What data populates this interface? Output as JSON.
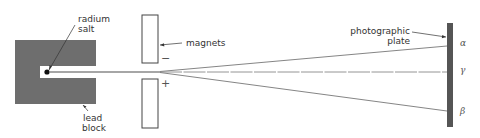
{
  "diagram": {
    "colors": {
      "lead": "#6e6e6e",
      "plate": "#555555",
      "rays": "#777777",
      "outline": "#444444",
      "text": "#333333"
    },
    "labels": {
      "source_line1": "radium",
      "source_line2": "salt",
      "block_line1": "lead",
      "block_line2": "block",
      "magnets": "magnets",
      "plate_line1": "photographic",
      "plate_line2": "plate",
      "minus": "−",
      "plus": "+"
    },
    "rays": [
      {
        "name": "alpha",
        "symbol": "α",
        "end_y": 46
      },
      {
        "name": "gamma",
        "symbol": "γ",
        "end_y": 72
      },
      {
        "name": "beta",
        "symbol": "β",
        "end_y": 111
      }
    ]
  }
}
